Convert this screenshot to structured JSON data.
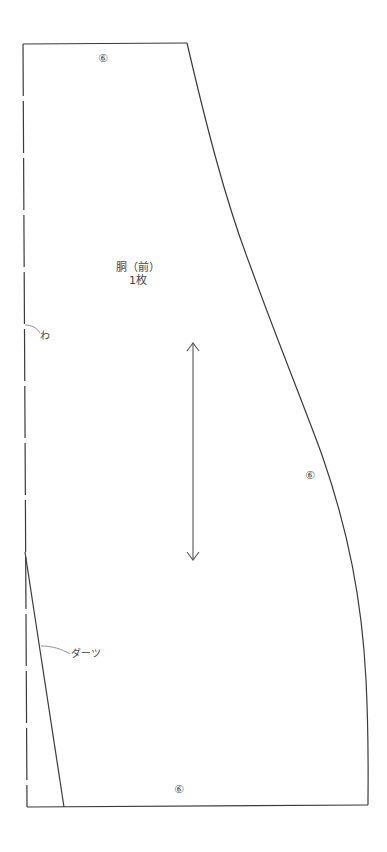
{
  "pattern": {
    "piece_name": "胴（前）",
    "piece_count": "1枚",
    "seam_allowance_marks": {
      "top": "⑥",
      "side": "⑥",
      "bottom": "⑥"
    },
    "annotations": {
      "fold": "わ",
      "dart": "ダーツ"
    },
    "grainline": "double-arrow-vertical"
  },
  "colors": {
    "outline": "#3a3a3a",
    "text": "#444444",
    "background": "#ffffff"
  }
}
